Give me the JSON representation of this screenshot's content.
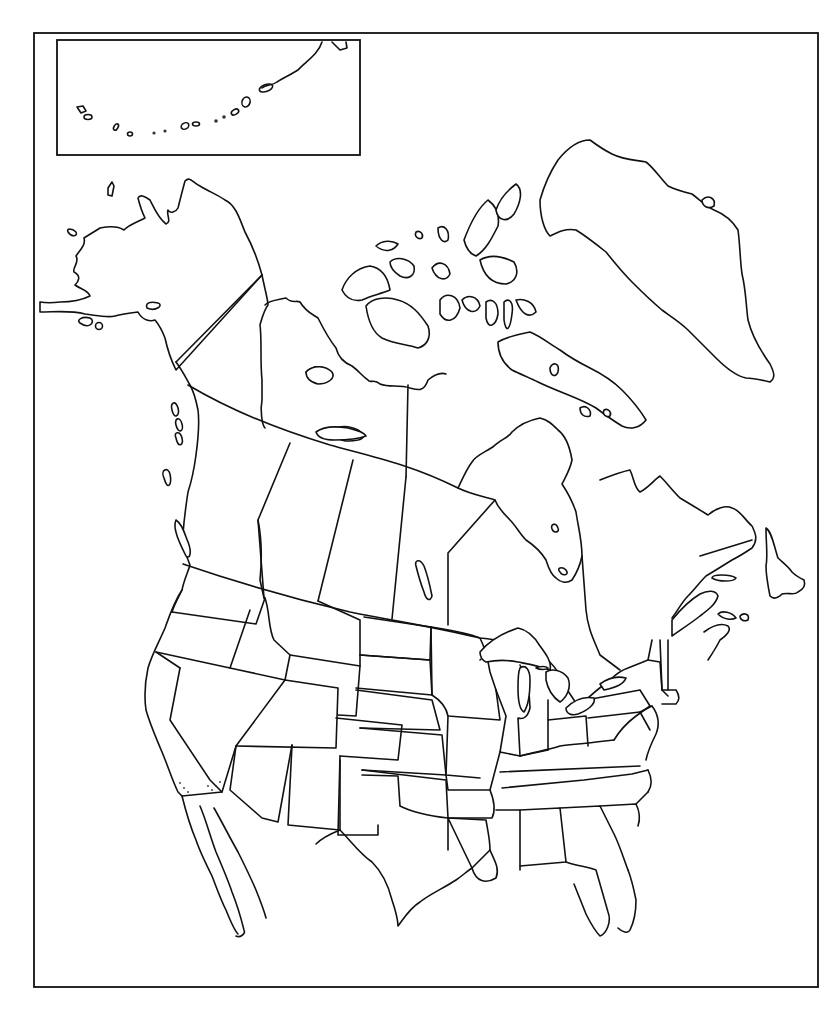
{
  "map": {
    "type": "blank outline map",
    "region": "North America",
    "labels": [],
    "colors": {
      "background": "#ffffff",
      "stroke": "#111111"
    },
    "frame": {
      "x": 34,
      "y": 33,
      "width": 784,
      "height": 954
    },
    "inset": {
      "subject": "Aleutian Islands",
      "x": 57,
      "y": 40,
      "width": 303,
      "height": 115
    },
    "features": [
      "Alaska",
      "Canada provinces and territories",
      "Canadian Arctic Archipelago",
      "Greenland",
      "Contiguous United States state borders",
      "Great Lakes",
      "Mexico (northern)",
      "Baja California",
      "Florida",
      "Newfoundland",
      "Hudson Bay"
    ]
  }
}
